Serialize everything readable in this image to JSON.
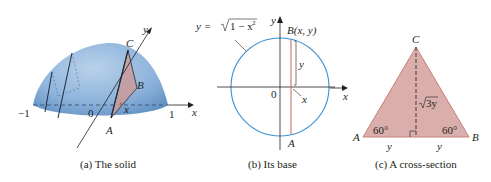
{
  "colors": {
    "solid_fill": "#8fb4dc",
    "solid_dark": "#5f8fc4",
    "cross_section_fill": "#d9aeab",
    "cross_section_stroke": "#c97f78",
    "circle_stroke": "#3a8fd0",
    "vertical_line": "#c9625a",
    "ink": "#231f20"
  },
  "panel_a": {
    "caption": "(a) The solid",
    "labels": {
      "minus_one": "−1",
      "zero": "0",
      "one": "1",
      "x_axis": "x",
      "y_axis": "y",
      "x_point": "x",
      "A": "A",
      "B": "B",
      "C": "C"
    }
  },
  "panel_b": {
    "caption": "(b) Its base",
    "equation_prefix": "y = ",
    "equation_radicand": "1 − x",
    "equation_exp": "2",
    "labels": {
      "y_axis": "y",
      "B_point": "B(x, y)",
      "y_length": "y",
      "zero": "0",
      "x_point": "x",
      "A": "A"
    }
  },
  "panel_c": {
    "caption": "(c) A cross-section",
    "labels": {
      "A": "A",
      "B": "B",
      "C": "C",
      "height": "3y",
      "angle_left": "60°",
      "angle_right": "60°",
      "base_left": "y",
      "base_right": "y",
      "x_axis": "x"
    }
  }
}
